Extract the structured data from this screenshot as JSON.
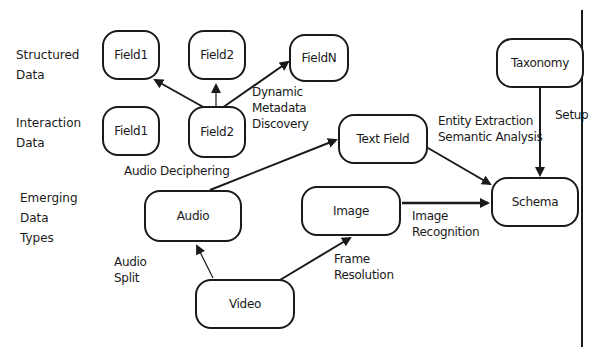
{
  "row_labels": {
    "structured": "Structured\nData",
    "interaction": "Interaction\nData",
    "emerging": "Emerging\nData\nTypes"
  },
  "nodes": {
    "structured_field1": "Field1",
    "structured_field2": "Field2",
    "structured_fieldn": "FieldN",
    "interaction_field1": "Field1",
    "interaction_field2": "Field2",
    "taxonomy": "Taxonomy",
    "text_field": "Text Field",
    "schema": "Schema",
    "audio": "Audio",
    "image": "Image",
    "video": "Video"
  },
  "edge_labels": {
    "dynamic_metadata": "Dynamic\nMetadata\nDiscovery",
    "audio_deciphering": "Audio Deciphering",
    "entity_extraction": "Entity Extraction\nSemantic Analysis",
    "setup": "Setup",
    "image_recognition": "Image\nRecognition",
    "audio_split": "Audio\nSplit",
    "frame_resolution": "Frame\nResolution"
  },
  "colors": {
    "stroke": "#1a1a1a",
    "background": "#ffffff"
  }
}
